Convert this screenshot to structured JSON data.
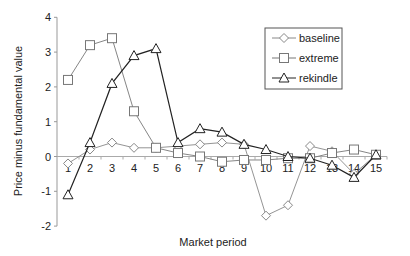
{
  "chart_data": {
    "type": "line",
    "title": "",
    "xlabel": "Market period",
    "ylabel": "Price minus fundamental value",
    "categories": [
      "1",
      "2",
      "3",
      "4",
      "5",
      "6",
      "7",
      "8",
      "9",
      "10",
      "11",
      "12",
      "13",
      "14",
      "15"
    ],
    "ylim": [
      -2,
      4
    ],
    "yticks": [
      -2,
      -1,
      0,
      1,
      2,
      3,
      4
    ],
    "grid": false,
    "legend_position": "upper right",
    "series": [
      {
        "name": "baseline",
        "marker": "diamond",
        "color": "#888888",
        "values": [
          -0.2,
          0.2,
          0.4,
          0.25,
          0.25,
          0.3,
          0.35,
          0.4,
          0.35,
          -1.7,
          -1.4,
          0.3,
          0.15,
          -0.5,
          0.05
        ]
      },
      {
        "name": "extreme",
        "marker": "square",
        "color": "#777777",
        "values": [
          2.2,
          3.2,
          3.4,
          1.3,
          0.25,
          0.1,
          0.0,
          -0.15,
          -0.1,
          -0.1,
          -0.05,
          -0.05,
          0.1,
          0.2,
          0.05
        ]
      },
      {
        "name": "rekindle",
        "marker": "triangle",
        "color": "#222222",
        "values": [
          -1.1,
          0.4,
          2.1,
          2.9,
          3.1,
          0.4,
          0.8,
          0.7,
          0.35,
          0.2,
          0.0,
          -0.05,
          -0.25,
          -0.6,
          0.05
        ]
      }
    ]
  }
}
